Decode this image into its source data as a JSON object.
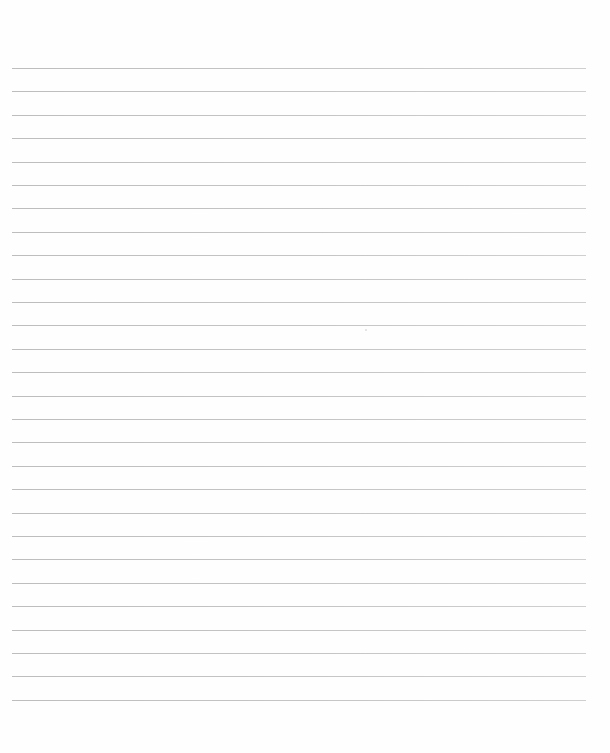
{
  "page": {
    "type": "blank ruled sheet",
    "background_color": "#ffffff",
    "line_color": "#c4c4c4",
    "line_count": 28,
    "first_line_y": 68,
    "line_spacing": 23.4,
    "line_left": 12,
    "line_right": 586
  }
}
